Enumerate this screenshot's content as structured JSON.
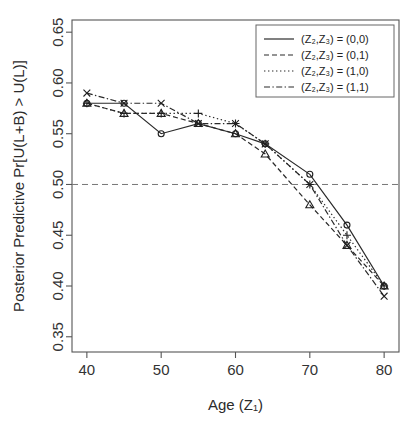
{
  "figure": {
    "background_color": "#ffffff",
    "line_color": "#2a2a2a"
  },
  "axes": {
    "x_title": "Age (Z₁)",
    "y_title": "Posterior  Predictive Pr[U(L+B) > U(L)]",
    "x_ticks": [
      "40",
      "50",
      "60",
      "70",
      "80"
    ],
    "y_ticks": [
      "0.35",
      "0.40",
      "0.45",
      "0.50",
      "0.55",
      "0.60",
      "0.65"
    ]
  },
  "legend": {
    "items": [
      {
        "label": "(Z₂,Z₃) = (0,0)",
        "style": "solid"
      },
      {
        "label": "(Z₂,Z₃) = (0,1)",
        "style": "dashed"
      },
      {
        "label": "(Z₂,Z₃) = (1,0)",
        "style": "dotted"
      },
      {
        "label": "(Z₂,Z₃) = (1,1)",
        "style": "dashdot"
      }
    ]
  },
  "annotations": {
    "reference_line_value": 0.5
  },
  "chart_data": {
    "type": "line",
    "title": "",
    "xlabel": "Age (Z₁)",
    "ylabel": "Posterior  Predictive Pr[U(L+B) > U(L)]",
    "xlim": [
      38,
      82
    ],
    "ylim": [
      0.335,
      0.662
    ],
    "grid": false,
    "legend_position": "top-right",
    "reference_lines": [
      {
        "orientation": "horizontal",
        "value": 0.5,
        "style": "dashed"
      }
    ],
    "x": [
      40,
      45,
      50,
      55,
      60,
      64,
      70,
      75,
      80
    ],
    "series": [
      {
        "name": "(Z₂,Z₃) = (0,0)",
        "style": "solid",
        "marker": "circle",
        "values": [
          0.58,
          0.58,
          0.55,
          0.56,
          0.55,
          0.54,
          0.51,
          0.46,
          0.4
        ]
      },
      {
        "name": "(Z₂,Z₃) = (0,1)",
        "style": "dashed",
        "marker": "triangle",
        "values": [
          0.58,
          0.57,
          0.57,
          0.56,
          0.55,
          0.53,
          0.48,
          0.44,
          0.4
        ]
      },
      {
        "name": "(Z₂,Z₃) = (1,0)",
        "style": "dotted",
        "marker": "plus",
        "values": [
          0.58,
          0.57,
          0.57,
          0.57,
          0.56,
          0.54,
          0.5,
          0.45,
          0.4
        ]
      },
      {
        "name": "(Z₂,Z₃) = (1,1)",
        "style": "dashdot",
        "marker": "cross",
        "values": [
          0.59,
          0.58,
          0.58,
          0.56,
          0.56,
          0.54,
          0.5,
          0.44,
          0.39
        ]
      }
    ]
  }
}
